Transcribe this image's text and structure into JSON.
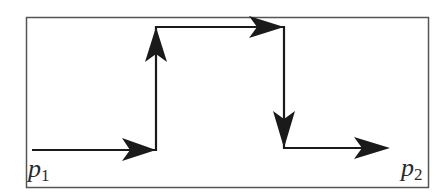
{
  "diagram": {
    "type": "path-diagram",
    "colors": {
      "stroke": "#1a1a1a",
      "border": "#555555",
      "background": "#ffffff"
    },
    "labels": {
      "start": {
        "base": "p",
        "sub": "1"
      },
      "end": {
        "base": "p",
        "sub": "2"
      }
    },
    "segments": [
      {
        "direction": "right",
        "from": [
          32,
          150
        ],
        "to": [
          156,
          150
        ]
      },
      {
        "direction": "up",
        "from": [
          156,
          150
        ],
        "to": [
          156,
          27
        ]
      },
      {
        "direction": "right",
        "from": [
          156,
          27
        ],
        "to": [
          284,
          27
        ]
      },
      {
        "direction": "down",
        "from": [
          284,
          27
        ],
        "to": [
          284,
          148
        ]
      },
      {
        "direction": "right",
        "from": [
          284,
          148
        ],
        "to": [
          388,
          148
        ]
      }
    ]
  }
}
